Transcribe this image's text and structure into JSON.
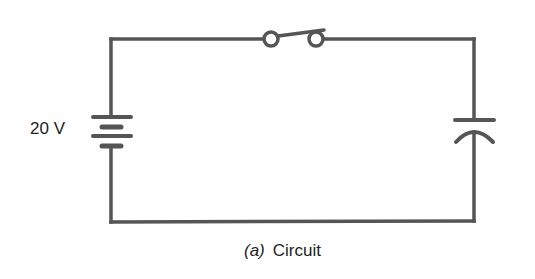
{
  "diagram": {
    "title": "Circuit",
    "caption": {
      "tag": "(a)",
      "text": "Circuit"
    },
    "components": [
      {
        "type": "battery",
        "label": "20 V",
        "position": "left"
      },
      {
        "type": "switch",
        "state": "open",
        "position": "top"
      },
      {
        "type": "capacitor",
        "position": "right"
      }
    ],
    "colors": {
      "wire": "#555555",
      "background": "#ffffff",
      "text": "#222222"
    }
  }
}
